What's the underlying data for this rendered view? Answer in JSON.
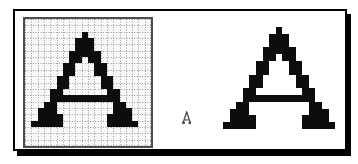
{
  "figure": {
    "glyph": "A",
    "colors": {
      "ink": "#0d0d0d",
      "grid_line": "#9b9b9b",
      "grid_bg": "#f9f9f9",
      "grid_border": "#4d4d4d",
      "frame_border": "#000000",
      "frame_shadow": "#000000",
      "background": "#ffffff"
    },
    "bitmap": {
      "glyph": "A",
      "cols": 17,
      "rows": 15,
      "pattern": [
        "........X........",
        ".......XXX.......",
        ".......XXX.......",
        "......XXXXX......",
        "......XX.XX......",
        ".....XX...XX.....",
        ".....XX...XX.....",
        "....XX.....XX....",
        "....XX.....XX....",
        "...XX.......XX...",
        "...XXXXXXXXXXX...",
        "..XX.........XX..",
        ".XXX.........XXX.",
        ".XXXX.......XXXX.",
        "XXXXX.......XXXXX"
      ]
    },
    "views": {
      "grid": {
        "label": "fatbits editing grid",
        "grid_cols": 20,
        "grid_rows": 20,
        "cell_w": 6.3,
        "cell_h": 6.35,
        "offset_col": 1,
        "offset_row": 2,
        "show_grid": true,
        "round": true
      },
      "actual": {
        "label": "actual size glyph",
        "cell_w": 0.55,
        "cell_h": 0.85,
        "round": false
      },
      "large": {
        "label": "enlarged glyph",
        "cell_w": 6.6,
        "cell_h": 6.8,
        "round": true
      }
    }
  }
}
